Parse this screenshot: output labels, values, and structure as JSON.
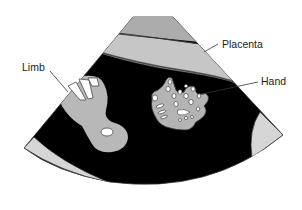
{
  "diagram": {
    "type": "ultrasound-schematic",
    "labels": {
      "limb": "Limb",
      "placenta": "Placenta",
      "hand": "Hand"
    },
    "colors": {
      "background": "#ffffff",
      "amniotic_fluid": "#000000",
      "tissue": "#b8b8b8",
      "placenta_light": "#c4c4c4",
      "placenta_dark": "#a9a9a9",
      "wall": "#d6d6d6",
      "outline": "#333333",
      "bone_white": "#ffffff"
    }
  }
}
